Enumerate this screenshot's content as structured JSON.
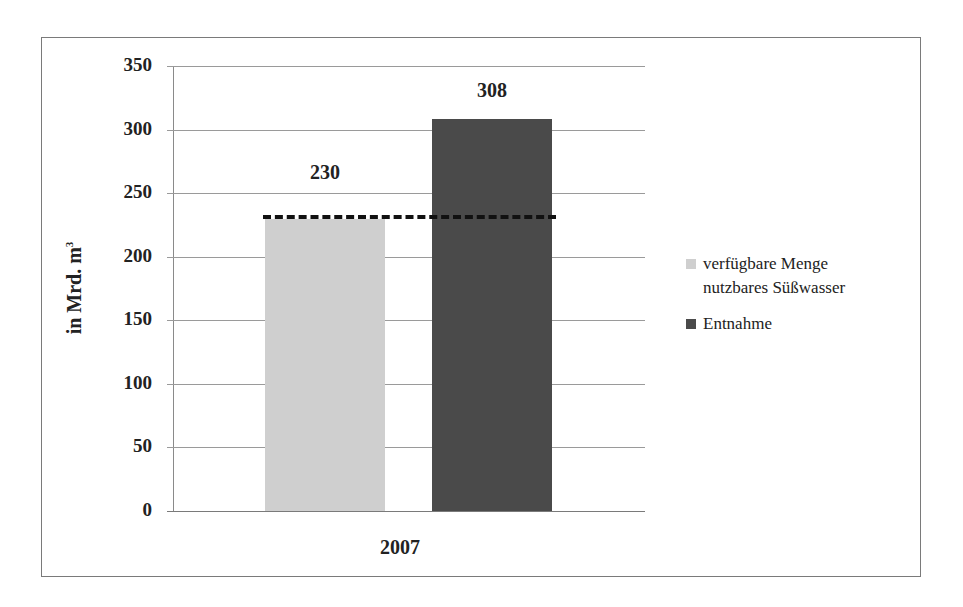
{
  "chart_data": {
    "type": "bar",
    "title": "",
    "xlabel": "",
    "ylabel": "in Mrd. m³",
    "ylabel_text": "in Mrd. m",
    "ylabel_sup": "3",
    "categories": [
      "2007"
    ],
    "series": [
      {
        "name": "verfügbare Menge nutzbares Süßwasser",
        "values": [
          230
        ],
        "color": "#cfcfcf"
      },
      {
        "name": "Entnahme",
        "values": [
          308
        ],
        "color": "#4a4a4a"
      }
    ],
    "data_labels": [
      "230",
      "308"
    ],
    "ylim": [
      0,
      350
    ],
    "yticks": [
      "0",
      "50",
      "100",
      "150",
      "200",
      "250",
      "300",
      "350"
    ],
    "grid": true,
    "legend_position": "right",
    "annotations": [
      {
        "type": "dashed-horizontal-line",
        "y": 230,
        "color": "#111111"
      }
    ]
  },
  "legend": {
    "items": [
      {
        "line1": "verfügbare Menge",
        "line2": "nutzbares Süßwasser",
        "color": "#cfcfcf"
      },
      {
        "line1": "Entnahme",
        "line2": "",
        "color": "#4a4a4a"
      }
    ]
  }
}
